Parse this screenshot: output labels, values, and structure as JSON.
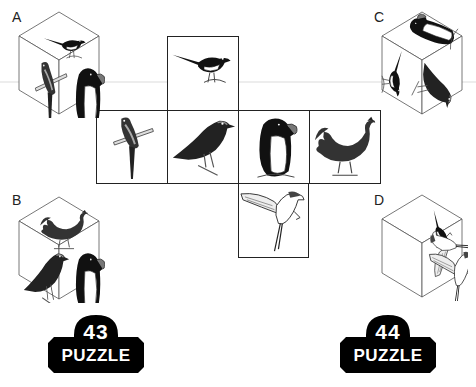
{
  "puzzle": {
    "type": "cube-net-folding",
    "net": {
      "cells": [
        {
          "position": "top",
          "bird": "magpie",
          "icon": "magpie-icon"
        },
        {
          "position": "middle-1",
          "bird": "parrot",
          "icon": "parrot-icon"
        },
        {
          "position": "middle-2",
          "bird": "crow",
          "icon": "crow-icon"
        },
        {
          "position": "middle-3",
          "bird": "penguin",
          "icon": "penguin-icon"
        },
        {
          "position": "middle-4",
          "bird": "rooster",
          "icon": "rooster-icon"
        },
        {
          "position": "bottom",
          "bird": "swallow",
          "icon": "swallow-icon"
        }
      ]
    },
    "options": [
      {
        "label": "A",
        "top": "magpie",
        "left": "parrot",
        "right": "penguin"
      },
      {
        "label": "B",
        "top": "rooster",
        "left": "crow",
        "right": "penguin"
      },
      {
        "label": "C",
        "top": "penguin",
        "left": "magpie",
        "right": "crow"
      },
      {
        "label": "D",
        "top": "magpie",
        "left": "swallow",
        "right": "swallow"
      }
    ]
  },
  "badges": [
    {
      "number": "43",
      "word": "PUZZLE"
    },
    {
      "number": "44",
      "word": "PUZZLE"
    }
  ],
  "colors": {
    "line": "#222222",
    "badge": "#000000",
    "badge_text": "#ffffff"
  }
}
